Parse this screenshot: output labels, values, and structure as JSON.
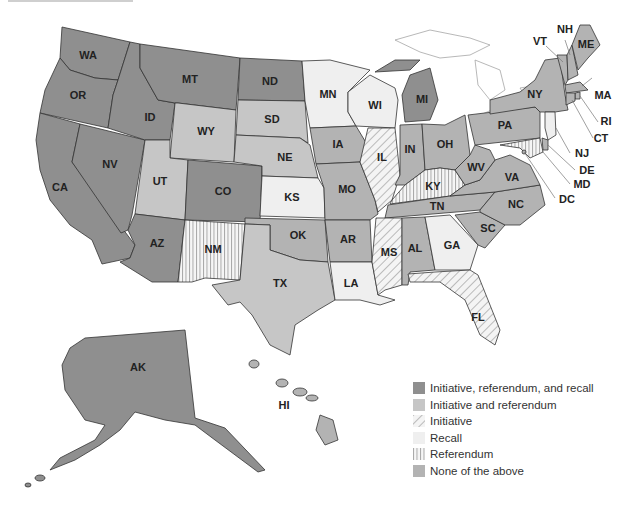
{
  "colors": {
    "irr": "#8f8f8f",
    "ir": "#c6c6c6",
    "none": "#b3b3b3",
    "recall": "#efefef",
    "stroke": "#333333",
    "background": "#ffffff"
  },
  "legend": {
    "items": [
      {
        "key": "irr",
        "label": "Initiative, referendum, and recall",
        "pattern": "solid-dark"
      },
      {
        "key": "ir",
        "label": "Initiative and referendum",
        "pattern": "solid-light"
      },
      {
        "key": "initiative",
        "label": "Initiative",
        "pattern": "diagonal-hatch"
      },
      {
        "key": "recall",
        "label": "Recall",
        "pattern": "solid-very-light"
      },
      {
        "key": "referendum",
        "label": "Referendum",
        "pattern": "vertical-lines"
      },
      {
        "key": "none",
        "label": "None of the above",
        "pattern": "solid-mid"
      }
    ]
  },
  "states": {
    "WA": {
      "label": "WA",
      "category": "irr"
    },
    "OR": {
      "label": "OR",
      "category": "irr"
    },
    "CA": {
      "label": "CA",
      "category": "irr"
    },
    "NV": {
      "label": "NV",
      "category": "irr"
    },
    "ID": {
      "label": "ID",
      "category": "irr"
    },
    "MT": {
      "label": "MT",
      "category": "irr"
    },
    "WY": {
      "label": "WY",
      "category": "ir"
    },
    "UT": {
      "label": "UT",
      "category": "ir"
    },
    "AZ": {
      "label": "AZ",
      "category": "irr"
    },
    "CO": {
      "label": "CO",
      "category": "irr"
    },
    "NM": {
      "label": "NM",
      "category": "referendum"
    },
    "ND": {
      "label": "ND",
      "category": "irr"
    },
    "SD": {
      "label": "SD",
      "category": "ir"
    },
    "NE": {
      "label": "NE",
      "category": "ir"
    },
    "KS": {
      "label": "KS",
      "category": "recall"
    },
    "OK": {
      "label": "OK",
      "category": "none"
    },
    "TX": {
      "label": "TX",
      "category": "ir"
    },
    "MN": {
      "label": "MN",
      "category": "recall"
    },
    "IA": {
      "label": "IA",
      "category": "none"
    },
    "MO": {
      "label": "MO",
      "category": "none"
    },
    "AR": {
      "label": "AR",
      "category": "none"
    },
    "LA": {
      "label": "LA",
      "category": "recall"
    },
    "WI": {
      "label": "WI",
      "category": "recall"
    },
    "IL": {
      "label": "IL",
      "category": "initiative"
    },
    "MI": {
      "label": "MI",
      "category": "irr"
    },
    "IN": {
      "label": "IN",
      "category": "none"
    },
    "OH": {
      "label": "OH",
      "category": "none"
    },
    "KY": {
      "label": "KY",
      "category": "referendum"
    },
    "TN": {
      "label": "TN",
      "category": "none"
    },
    "MS": {
      "label": "MS",
      "category": "initiative"
    },
    "AL": {
      "label": "AL",
      "category": "none"
    },
    "GA": {
      "label": "GA",
      "category": "recall"
    },
    "FL": {
      "label": "FL",
      "category": "initiative"
    },
    "SC": {
      "label": "SC",
      "category": "none"
    },
    "NC": {
      "label": "NC",
      "category": "none"
    },
    "VA": {
      "label": "VA",
      "category": "none"
    },
    "WV": {
      "label": "WV",
      "category": "none"
    },
    "PA": {
      "label": "PA",
      "category": "none"
    },
    "NY": {
      "label": "NY",
      "category": "none"
    },
    "VT": {
      "label": "VT",
      "category": "none"
    },
    "NH": {
      "label": "NH",
      "category": "none"
    },
    "ME": {
      "label": "ME",
      "category": "none"
    },
    "MA": {
      "label": "MA",
      "category": "none"
    },
    "RI": {
      "label": "RI",
      "category": "none"
    },
    "CT": {
      "label": "CT",
      "category": "none"
    },
    "NJ": {
      "label": "NJ",
      "category": "recall"
    },
    "DE": {
      "label": "DE",
      "category": "none"
    },
    "MD": {
      "label": "MD",
      "category": "referendum"
    },
    "DC": {
      "label": "DC",
      "category": "none"
    },
    "AK": {
      "label": "AK",
      "category": "irr"
    },
    "HI": {
      "label": "HI",
      "category": "none"
    }
  }
}
